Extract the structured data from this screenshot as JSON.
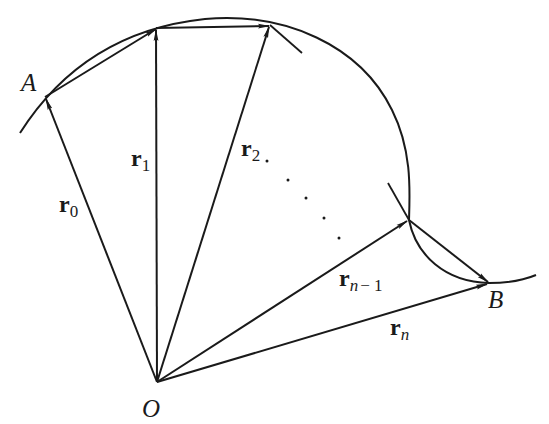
{
  "figure": {
    "stroke_color": "#1a1a1a",
    "background": "#ffffff",
    "points": {
      "origin": {
        "label": "O",
        "x": 157,
        "y": 382
      },
      "start": {
        "label": "A",
        "x": 45,
        "y": 97
      },
      "p1": {
        "x": 156,
        "y": 28
      },
      "p2": {
        "x": 270,
        "y": 25
      },
      "pn_minus_1": {
        "x": 409,
        "y": 220
      },
      "end": {
        "label": "B",
        "x": 489,
        "y": 283
      }
    },
    "vectors": [
      {
        "name": "r0",
        "base": "r",
        "sub": "0"
      },
      {
        "name": "r1",
        "base": "r",
        "sub": "1"
      },
      {
        "name": "r2",
        "base": "r",
        "sub": "2"
      },
      {
        "name": "rn-1",
        "base": "r",
        "sub": "n",
        "sub_suffix": "− 1"
      },
      {
        "name": "rn",
        "base": "r",
        "sub": "n"
      }
    ],
    "ellipsis": "…"
  }
}
